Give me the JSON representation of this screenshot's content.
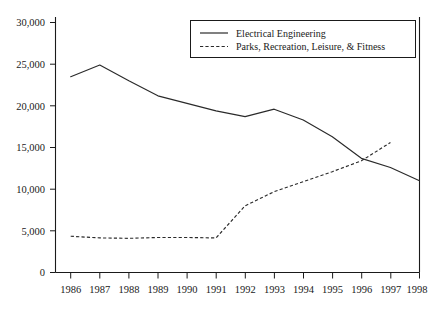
{
  "chart_data": {
    "type": "line",
    "title": "",
    "xlabel": "",
    "ylabel": "",
    "grid": false,
    "legend_position": "top-right",
    "x": [
      1986,
      1987,
      1988,
      1989,
      1990,
      1991,
      1992,
      1993,
      1994,
      1995,
      1996,
      1997,
      1998
    ],
    "categories": [
      "1986",
      "1987",
      "1988",
      "1989",
      "1990",
      "1991",
      "1992",
      "1993",
      "1994",
      "1995",
      "1996",
      "1997",
      "1998"
    ],
    "xlim": [
      1986,
      1998
    ],
    "ylim": [
      0,
      30000
    ],
    "yticks": [
      0,
      5000,
      10000,
      15000,
      20000,
      25000,
      30000
    ],
    "ytick_labels": [
      "0",
      "5,000",
      "10,000",
      "15,000",
      "20,000",
      "25,000",
      "30,000"
    ],
    "xtick_labels": [
      "1986",
      "1987",
      "1988",
      "1989",
      "1990",
      "1991",
      "1992",
      "1993",
      "1994",
      "1995",
      "1996",
      "1997",
      "1998"
    ],
    "series": [
      {
        "name": "Electrical Engineering",
        "style": "solid",
        "color": "#2a2a2a",
        "values": [
          23500,
          24900,
          23000,
          21200,
          20300,
          19400,
          18700,
          19600,
          18300,
          16300,
          13700,
          12600,
          11000
        ]
      },
      {
        "name": "Parks, Recreation, Leisure, & Fitness",
        "style": "dashed",
        "color": "#2a2a2a",
        "values": [
          4350,
          4150,
          4100,
          4200,
          4200,
          4150,
          8000,
          9700,
          10900,
          12100,
          13400,
          15600,
          null
        ]
      }
    ]
  },
  "legend": {
    "entries": [
      {
        "label": "Electrical Engineering",
        "style": "solid"
      },
      {
        "label": "Parks, Recreation, Leisure, & Fitness",
        "style": "dashed"
      }
    ]
  },
  "axes": {
    "y_labels": [
      "30,000",
      "25,000",
      "20,000",
      "15,000",
      "10,000",
      "5,000",
      "0"
    ],
    "x_labels": [
      "1986",
      "1987",
      "1988",
      "1989",
      "1990",
      "1991",
      "1992",
      "1993",
      "1994",
      "1995",
      "1996",
      "1997",
      "1998"
    ]
  }
}
